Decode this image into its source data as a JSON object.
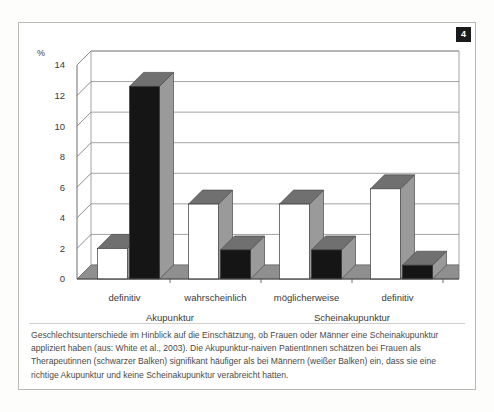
{
  "figure": {
    "badge_number": "4",
    "caption": "Geschlechtsunterschiede im Hinblick auf die Einschätzung, ob Frauen oder Männer eine Scheinakupunktur appliziert haben (aus: White et al., 2003). Die Akupunktur-naiven PatientInnen schätzen bei Frauen als Therapeutinnen (schwarzer Balken) signifikant häufiger als bei Männern (weißer Balken) ein, dass sie eine richtige Akupunktur und keine Scheinakupunktur verabreicht hatten."
  },
  "chart_data": {
    "type": "bar",
    "title": "",
    "subtitle": "",
    "xlabel": "",
    "ylabel": "%",
    "ylim": [
      0,
      14
    ],
    "yticks": [
      0,
      2,
      4,
      6,
      8,
      10,
      12,
      14
    ],
    "ytick_labels": [
      "0",
      "2",
      "4",
      "6",
      "8",
      "10",
      "12",
      "14"
    ],
    "grid": true,
    "legend_position": "none",
    "categories": [
      "definitiv",
      "wahrscheinlich",
      "möglicherweise",
      "definitiv"
    ],
    "group_labels": [
      "Akupunktur",
      "Scheinakupunktur"
    ],
    "group_spans": [
      2,
      2
    ],
    "series": [
      {
        "name": "weißer Balken (Männer)",
        "color": "#ffffff",
        "values": [
          2.0,
          4.9,
          4.9,
          5.9
        ]
      },
      {
        "name": "schwarzer Balken (Frauen)",
        "color": "#151515",
        "values": [
          12.6,
          1.9,
          1.9,
          0.9
        ]
      }
    ],
    "annotations": []
  },
  "style": {
    "grid_color": "#8d8d8a",
    "axis_color": "#6f6f6d",
    "bar_top_gray": "#707070",
    "bar_side_gray": "#9a9a9a",
    "floor_gray": "#8f8f8f",
    "badge_bg": "#1a1a1a",
    "badge_fg": "#ffffff",
    "text_color": "#3a3a3a"
  }
}
